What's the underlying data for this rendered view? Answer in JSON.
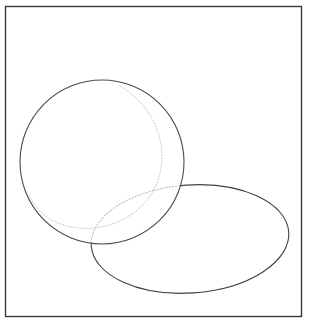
{
  "figure": {
    "canvas": {
      "width": 309,
      "height": 324,
      "background": "#ffffff"
    },
    "frame": {
      "label": "figure-border",
      "x": 5.5,
      "y": 6.5,
      "width": 296,
      "height": 310,
      "stroke": "#3a3a3a",
      "stroke_width": 1.4,
      "fill": "none"
    },
    "shapes": [
      {
        "id": "sphere-outline",
        "label": "circle",
        "type": "circle",
        "cx": 102,
        "cy": 162,
        "r": 82,
        "stroke": "#4a4a52",
        "stroke_width": 1.1,
        "fill": "#ffffff",
        "style": "solid"
      },
      {
        "id": "disk-outline",
        "label": "ellipse",
        "type": "ellipse",
        "cx": 190,
        "cy": 239,
        "rx": 99,
        "ry": 54,
        "rotation_deg": -4,
        "stroke": "#3f3f46",
        "stroke_width": 1.1,
        "fill": "none",
        "style": "solid",
        "occluded_by": "sphere-outline"
      },
      {
        "id": "hidden-arc",
        "label": "hidden-ellipse-arc",
        "type": "ellipse-arc",
        "cx": 190,
        "cy": 239,
        "rx": 99,
        "ry": 54,
        "rotation_deg": -4,
        "stroke": "#b0b0b8",
        "stroke_width": 1.0,
        "dash": "1 2",
        "fill": "none",
        "style": "dotted",
        "description": "portion of the elliptical disk hidden behind the sphere"
      },
      {
        "id": "terminator-arc",
        "label": "crescent-terminator",
        "type": "arc",
        "stroke": "#c2c2ca",
        "stroke_width": 1.0,
        "dash": "1 2",
        "fill": "none",
        "style": "dotted",
        "description": "dotted crescent boundary inside the circle"
      }
    ],
    "colors": {
      "border": "#3a3a3a",
      "solid_stroke": "#3f3f46",
      "dotted_stroke": "#b6b6be",
      "background": "#ffffff"
    }
  }
}
